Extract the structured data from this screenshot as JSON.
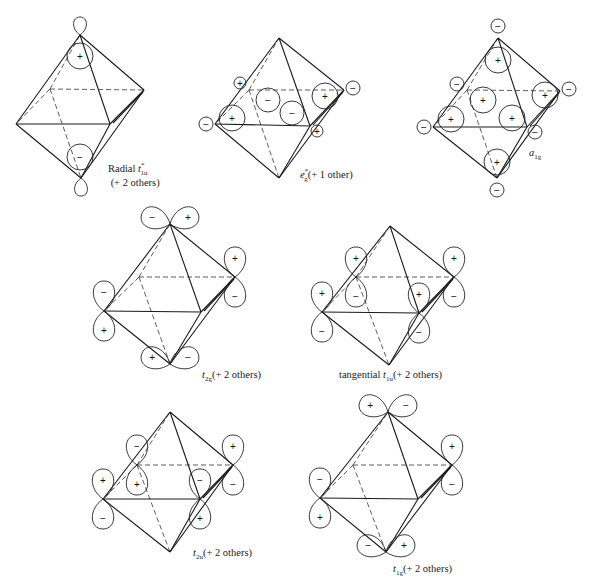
{
  "figure": {
    "diagrams": [
      {
        "id": "radial-t1u",
        "caption": {
          "prefix": "Radial ",
          "symbol": "t",
          "sub": "1u",
          "sup": "*",
          "suffix": "",
          "line2": "(+ 2 others)"
        },
        "caption_pos": [
          108,
          162
        ],
        "vertices": {
          "top": [
            80,
            35
          ],
          "back_left": [
            50,
            89
          ],
          "back_right": [
            144,
            90
          ],
          "left": [
            16,
            124
          ],
          "front_right": [
            110,
            124
          ],
          "bottom": [
            81,
            178
          ]
        },
        "lobes": [
          {
            "type": "loop",
            "cx": 80,
            "cy": 26,
            "r": 7,
            "dir": "up",
            "sign": ""
          },
          {
            "type": "circle",
            "cx": 80,
            "cy": 56,
            "r": 13,
            "sign": "+"
          },
          {
            "type": "circle",
            "cx": 80,
            "cy": 157,
            "r": 13,
            "sign": "−"
          },
          {
            "type": "loop",
            "cx": 81,
            "cy": 187,
            "r": 7,
            "dir": "down",
            "sign": ""
          }
        ]
      },
      {
        "id": "eg-star",
        "caption": {
          "prefix": "",
          "symbol": "e",
          "sub": "g",
          "sup": "*",
          "suffix": "(+ 1 other)",
          "line2": ""
        },
        "caption_pos": [
          300,
          168
        ],
        "vertices": {
          "top": [
            279,
            38
          ],
          "back_left": [
            249,
            90
          ],
          "back_right": [
            344,
            90
          ],
          "left": [
            215,
            124
          ],
          "front_right": [
            310,
            126
          ],
          "bottom": [
            279,
            178
          ]
        },
        "lobes": [
          {
            "type": "circle",
            "cx": 240,
            "cy": 83,
            "r": 6,
            "sign": "+"
          },
          {
            "type": "circle",
            "cx": 232,
            "cy": 118,
            "r": 13,
            "sign": "+"
          },
          {
            "type": "circle",
            "cx": 206,
            "cy": 124,
            "r": 7,
            "sign": "−"
          },
          {
            "type": "teardrop",
            "cx": 268,
            "cy": 100,
            "r": 12,
            "sign": "−"
          },
          {
            "type": "teardrop",
            "cx": 292,
            "cy": 113,
            "r": 12,
            "sign": "−"
          },
          {
            "type": "circle",
            "cx": 325,
            "cy": 96,
            "r": 13,
            "sign": "+"
          },
          {
            "type": "circle",
            "cx": 353,
            "cy": 88,
            "r": 7,
            "sign": "−"
          },
          {
            "type": "circle",
            "cx": 317,
            "cy": 131,
            "r": 6,
            "sign": "+"
          }
        ]
      },
      {
        "id": "a1g",
        "caption": {
          "prefix": "",
          "symbol": "a",
          "sub": "1g",
          "sup": "",
          "suffix": "",
          "line2": ""
        },
        "caption_pos": [
          529,
          147
        ],
        "vertices": {
          "top": [
            498,
            38
          ],
          "back_left": [
            467,
            90
          ],
          "back_right": [
            560,
            91
          ],
          "left": [
            433,
            127
          ],
          "front_right": [
            527,
            127
          ],
          "bottom": [
            497,
            178
          ]
        },
        "lobes": [
          {
            "type": "circle",
            "cx": 498,
            "cy": 26,
            "r": 7,
            "sign": "−"
          },
          {
            "type": "circle",
            "cx": 498,
            "cy": 60,
            "r": 13,
            "sign": "+"
          },
          {
            "type": "circle",
            "cx": 457,
            "cy": 84,
            "r": 7,
            "sign": "−"
          },
          {
            "type": "circle",
            "cx": 483,
            "cy": 100,
            "r": 13,
            "sign": "+"
          },
          {
            "type": "circle",
            "cx": 451,
            "cy": 119,
            "r": 13,
            "sign": "+"
          },
          {
            "type": "circle",
            "cx": 424,
            "cy": 127,
            "r": 7,
            "sign": "−"
          },
          {
            "type": "circle",
            "cx": 512,
            "cy": 118,
            "r": 13,
            "sign": "+"
          },
          {
            "type": "circle",
            "cx": 545,
            "cy": 95,
            "r": 13,
            "sign": "+"
          },
          {
            "type": "circle",
            "cx": 569,
            "cy": 89,
            "r": 7,
            "sign": "−"
          },
          {
            "type": "circle",
            "cx": 535,
            "cy": 132,
            "r": 7,
            "sign": "−"
          },
          {
            "type": "circle",
            "cx": 497,
            "cy": 162,
            "r": 13,
            "sign": "+"
          },
          {
            "type": "circle",
            "cx": 497,
            "cy": 190,
            "r": 7,
            "sign": "−"
          }
        ]
      },
      {
        "id": "t2g",
        "caption": {
          "prefix": "",
          "symbol": "t",
          "sub": "2g",
          "sup": "",
          "suffix": "(+ 2 others)",
          "line2": ""
        },
        "caption_pos": [
          202,
          369
        ],
        "vertices": {
          "top": [
            170,
            224
          ],
          "back_left": [
            139,
            277
          ],
          "back_right": [
            235,
            277
          ],
          "left": [
            104,
            311
          ],
          "front_right": [
            201,
            312
          ],
          "bottom": [
            170,
            364
          ]
        },
        "lobes": [
          {
            "type": "pair",
            "x": 170,
            "y": 224,
            "angle": 0,
            "signs": [
              "−",
              "+"
            ]
          },
          {
            "type": "pair",
            "x": 235,
            "y": 277,
            "angle": 90,
            "signs": [
              "+",
              "−"
            ]
          },
          {
            "type": "pair",
            "x": 104,
            "y": 311,
            "angle": 90,
            "signs": [
              "−",
              "+"
            ]
          },
          {
            "type": "pair",
            "x": 170,
            "y": 364,
            "angle": 0,
            "signs": [
              "+",
              "−"
            ]
          }
        ]
      },
      {
        "id": "tangential-t1u",
        "caption": {
          "prefix": "tangential   ",
          "symbol": "t",
          "sub": "1u",
          "sup": "",
          "suffix": "(+ 2 others)",
          "line2": ""
        },
        "caption_pos": [
          339,
          369
        ],
        "vertices": {
          "top": [
            390,
            226
          ],
          "back_left": [
            356,
            277
          ],
          "back_right": [
            454,
            277
          ],
          "left": [
            322,
            312
          ],
          "front_right": [
            419,
            313
          ],
          "bottom": [
            389,
            365
          ]
        },
        "lobes": [
          {
            "type": "pair",
            "x": 356,
            "y": 277,
            "angle": 90,
            "signs": [
              "+",
              "−"
            ]
          },
          {
            "type": "pair",
            "x": 454,
            "y": 277,
            "angle": 90,
            "signs": [
              "+",
              "−"
            ]
          },
          {
            "type": "pair",
            "x": 322,
            "y": 312,
            "angle": 90,
            "signs": [
              "+",
              "−"
            ]
          },
          {
            "type": "pair",
            "x": 419,
            "y": 313,
            "angle": 90,
            "signs": [
              "+",
              "−"
            ]
          }
        ]
      },
      {
        "id": "t2u",
        "caption": {
          "prefix": "",
          "symbol": "t",
          "sub": "2u",
          "sup": "",
          "suffix": "(+ 2 others)",
          "line2": ""
        },
        "caption_pos": [
          193,
          547
        ],
        "vertices": {
          "top": [
            170,
            412
          ],
          "back_left": [
            137,
            465
          ],
          "back_right": [
            233,
            465
          ],
          "left": [
            103,
            499
          ],
          "front_right": [
            200,
            499
          ],
          "bottom": [
            170,
            552
          ]
        },
        "lobes": [
          {
            "type": "pair",
            "x": 137,
            "y": 465,
            "angle": 90,
            "signs": [
              "−",
              "+"
            ]
          },
          {
            "type": "pair",
            "x": 233,
            "y": 465,
            "angle": 90,
            "signs": [
              "+",
              "−"
            ]
          },
          {
            "type": "pair",
            "x": 103,
            "y": 499,
            "angle": 90,
            "signs": [
              "+",
              "−"
            ]
          },
          {
            "type": "pair",
            "x": 200,
            "y": 499,
            "angle": 90,
            "signs": [
              "−",
              "+"
            ]
          }
        ]
      },
      {
        "id": "t1g",
        "caption": {
          "prefix": "",
          "symbol": "t",
          "sub": "1g",
          "sup": "",
          "suffix": "(+ 2 others)",
          "line2": ""
        },
        "caption_pos": [
          393,
          563
        ],
        "vertices": {
          "top": [
            388,
            412
          ],
          "back_left": [
            353,
            465
          ],
          "back_right": [
            452,
            465
          ],
          "left": [
            320,
            498
          ],
          "front_right": [
            418,
            499
          ],
          "bottom": [
            386,
            552
          ]
        },
        "lobes": [
          {
            "type": "pair",
            "x": 388,
            "y": 412,
            "angle": 0,
            "signs": [
              "+",
              "−"
            ]
          },
          {
            "type": "pair",
            "x": 452,
            "y": 465,
            "angle": 90,
            "signs": [
              "+",
              "−"
            ]
          },
          {
            "type": "pair",
            "x": 320,
            "y": 498,
            "angle": 90,
            "signs": [
              "−",
              "+"
            ]
          },
          {
            "type": "pair",
            "x": 386,
            "y": 552,
            "angle": 0,
            "signs": [
              "−",
              "+"
            ]
          }
        ]
      }
    ]
  }
}
